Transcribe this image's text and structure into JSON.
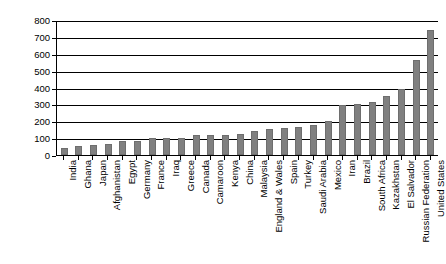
{
  "chart_data": {
    "type": "bar",
    "title": "",
    "subtitle": "",
    "xlabel": "",
    "ylabel": "",
    "ylim": [
      0,
      800
    ],
    "yticks": [
      0,
      100,
      200,
      300,
      400,
      500,
      600,
      700,
      800
    ],
    "grid": true,
    "legend": false,
    "legend_position": "none",
    "bar_color": "#808080",
    "axis_color": "#000000",
    "categories": [
      "India",
      "Ghana",
      "Japan",
      "Afghanistan",
      "Egypt",
      "Germany",
      "France",
      "Iraq",
      "Greece",
      "Canada",
      "Camaroon",
      "Kenya",
      "China",
      "Malaysia",
      "England & Wales",
      "Spain",
      "Turkey",
      "Saudi Arabia",
      "Mexico",
      "Iran",
      "Brazil",
      "South Africa",
      "Kazakhstan",
      "El Salvador",
      "Russian Federation",
      "United States"
    ],
    "values": [
      42,
      55,
      58,
      63,
      82,
      85,
      100,
      98,
      100,
      118,
      118,
      120,
      122,
      140,
      152,
      160,
      167,
      180,
      200,
      295,
      303,
      315,
      350,
      392,
      563,
      742
    ]
  }
}
